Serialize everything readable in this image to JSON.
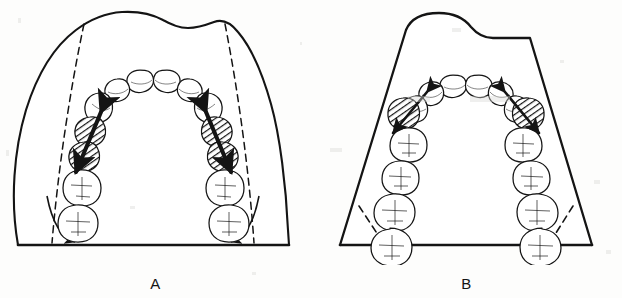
{
  "figure": {
    "type": "line-drawing",
    "background_color": "#fdfdfc",
    "ink_color": "#141414",
    "panels": [
      {
        "id": "A",
        "label": "A",
        "cast_outline_style": "irregular-organic",
        "base_line": "straight-horizontal",
        "reference_lines": {
          "style": "dashed",
          "count": 2,
          "description": "two long dashed lines running from upper cast border down to the base line"
        },
        "corner_arrows": {
          "style": "curved-arrow",
          "count": 2,
          "direction": "inward-down-toward-baseline",
          "description": "curved arrows at each lower corner sweeping from the dashed line toward the flat base"
        },
        "transverse_arrow": {
          "style": "thick-double-headed",
          "count": 2,
          "description": "thick straight arrow drawn through the two hatched premolars on each side"
        },
        "teeth_per_side": {
          "incisors": 2,
          "canine": 1,
          "hatched_premolars": 2,
          "molars": 2
        },
        "hatched_teeth_label": "premolars (shaded with diagonal hatching)"
      },
      {
        "id": "B",
        "label": "B",
        "cast_outline_style": "trapezoidal-straight-sided",
        "base_line": "straight-horizontal",
        "reference_lines": {
          "style": "dashed",
          "count": 2,
          "description": "two short dashed diagonals at the lower corners only"
        },
        "corner_arrows": {
          "style": "none",
          "count": 0,
          "direction": "",
          "description": "no curved corner arrows in this panel"
        },
        "transverse_arrow": {
          "style": "thin-double-headed",
          "count": 2,
          "description": "slim arrow drawn through the single hatched premolar on each side"
        },
        "teeth_per_side": {
          "incisors": 2,
          "canine": 1,
          "hatched_premolars": 1,
          "molars": 4
        },
        "hatched_teeth_label": "first premolar (shaded with diagonal hatching)"
      }
    ]
  }
}
